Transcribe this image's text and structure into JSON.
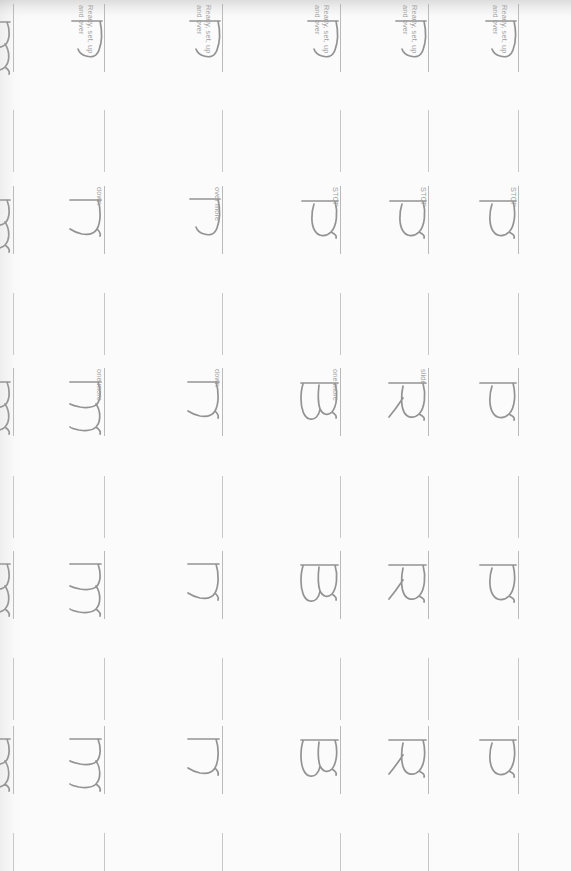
{
  "document": {
    "kind": "handwriting-practice-worksheet",
    "page_orientation": "rotated-90-clockwise",
    "background_color": "#fefefe",
    "ink_color": "#1a1a1a",
    "rule_color": "#8c8c8c"
  },
  "cues": {
    "ready_set": "Ready, set, up\nand over",
    "stop": "STOP",
    "slide": "slide",
    "down": "down",
    "over_more": "over more",
    "one_more": "one more"
  },
  "columns": [
    {
      "id": "col-m-left",
      "letter": "m",
      "x": 13,
      "rows": [
        {
          "row": 1,
          "glyph": "m",
          "cue": null
        },
        {
          "row": 2,
          "glyph": "m",
          "cue": null
        },
        {
          "row": 3,
          "glyph": "m",
          "cue": null
        },
        {
          "row": 4,
          "glyph": "m",
          "cue": null
        },
        {
          "row": 5,
          "glyph": "m",
          "cue": null
        }
      ]
    },
    {
      "id": "col-m",
      "letter": "m",
      "x": 104,
      "rows": [
        {
          "row": 1,
          "glyph": "stroke",
          "cue": "ready_set"
        },
        {
          "row": 2,
          "glyph": "n",
          "cue": "down"
        },
        {
          "row": 3,
          "glyph": "m",
          "cue": "one_more"
        },
        {
          "row": 4,
          "glyph": "m",
          "cue": null
        },
        {
          "row": 5,
          "glyph": "m",
          "cue": null
        }
      ]
    },
    {
      "id": "col-n",
      "letter": "n",
      "x": 222,
      "rows": [
        {
          "row": 1,
          "glyph": "stroke",
          "cue": "ready_set"
        },
        {
          "row": 2,
          "glyph": "stroke",
          "cue": "over_more"
        },
        {
          "row": 3,
          "glyph": "n",
          "cue": "down"
        },
        {
          "row": 4,
          "glyph": "n",
          "cue": null
        },
        {
          "row": 5,
          "glyph": "n",
          "cue": null
        }
      ]
    },
    {
      "id": "col-b",
      "letter": "B",
      "x": 340,
      "rows": [
        {
          "row": 1,
          "glyph": "stroke",
          "cue": "ready_set"
        },
        {
          "row": 2,
          "glyph": "P",
          "cue": "stop"
        },
        {
          "row": 3,
          "glyph": "B",
          "cue": "one_more"
        },
        {
          "row": 4,
          "glyph": "B",
          "cue": null
        },
        {
          "row": 5,
          "glyph": "B",
          "cue": null
        }
      ]
    },
    {
      "id": "col-r",
      "letter": "R",
      "x": 428,
      "rows": [
        {
          "row": 1,
          "glyph": "stroke",
          "cue": "ready_set"
        },
        {
          "row": 2,
          "glyph": "P",
          "cue": "stop"
        },
        {
          "row": 3,
          "glyph": "R",
          "cue": "slide"
        },
        {
          "row": 4,
          "glyph": "R",
          "cue": null
        },
        {
          "row": 5,
          "glyph": "R",
          "cue": null
        }
      ]
    },
    {
      "id": "col-p",
      "letter": "P",
      "x": 518,
      "rows": [
        {
          "row": 1,
          "glyph": "stroke",
          "cue": "ready_set"
        },
        {
          "row": 2,
          "glyph": "P",
          "cue": "stop"
        },
        {
          "row": 3,
          "glyph": "P",
          "cue": null
        },
        {
          "row": 4,
          "glyph": "P",
          "cue": null
        },
        {
          "row": 5,
          "glyph": "P",
          "cue": null
        }
      ]
    }
  ],
  "rows": [
    {
      "row": 1,
      "glyph_y": 18,
      "rule_y": 4,
      "rule_h": 68,
      "gap_rule_y": 110,
      "gap_rule_h": 62
    },
    {
      "row": 2,
      "glyph_y": 196,
      "rule_y": 186,
      "rule_h": 68,
      "gap_rule_y": 293,
      "gap_rule_h": 62
    },
    {
      "row": 3,
      "glyph_y": 378,
      "rule_y": 368,
      "rule_h": 68,
      "gap_rule_y": 476,
      "gap_rule_h": 62
    },
    {
      "row": 4,
      "glyph_y": 560,
      "rule_y": 551,
      "rule_h": 68,
      "gap_rule_y": 658,
      "gap_rule_h": 62
    },
    {
      "row": 5,
      "glyph_y": 735,
      "rule_y": 726,
      "rule_h": 68,
      "gap_rule_y": 833,
      "gap_rule_h": 38
    }
  ]
}
